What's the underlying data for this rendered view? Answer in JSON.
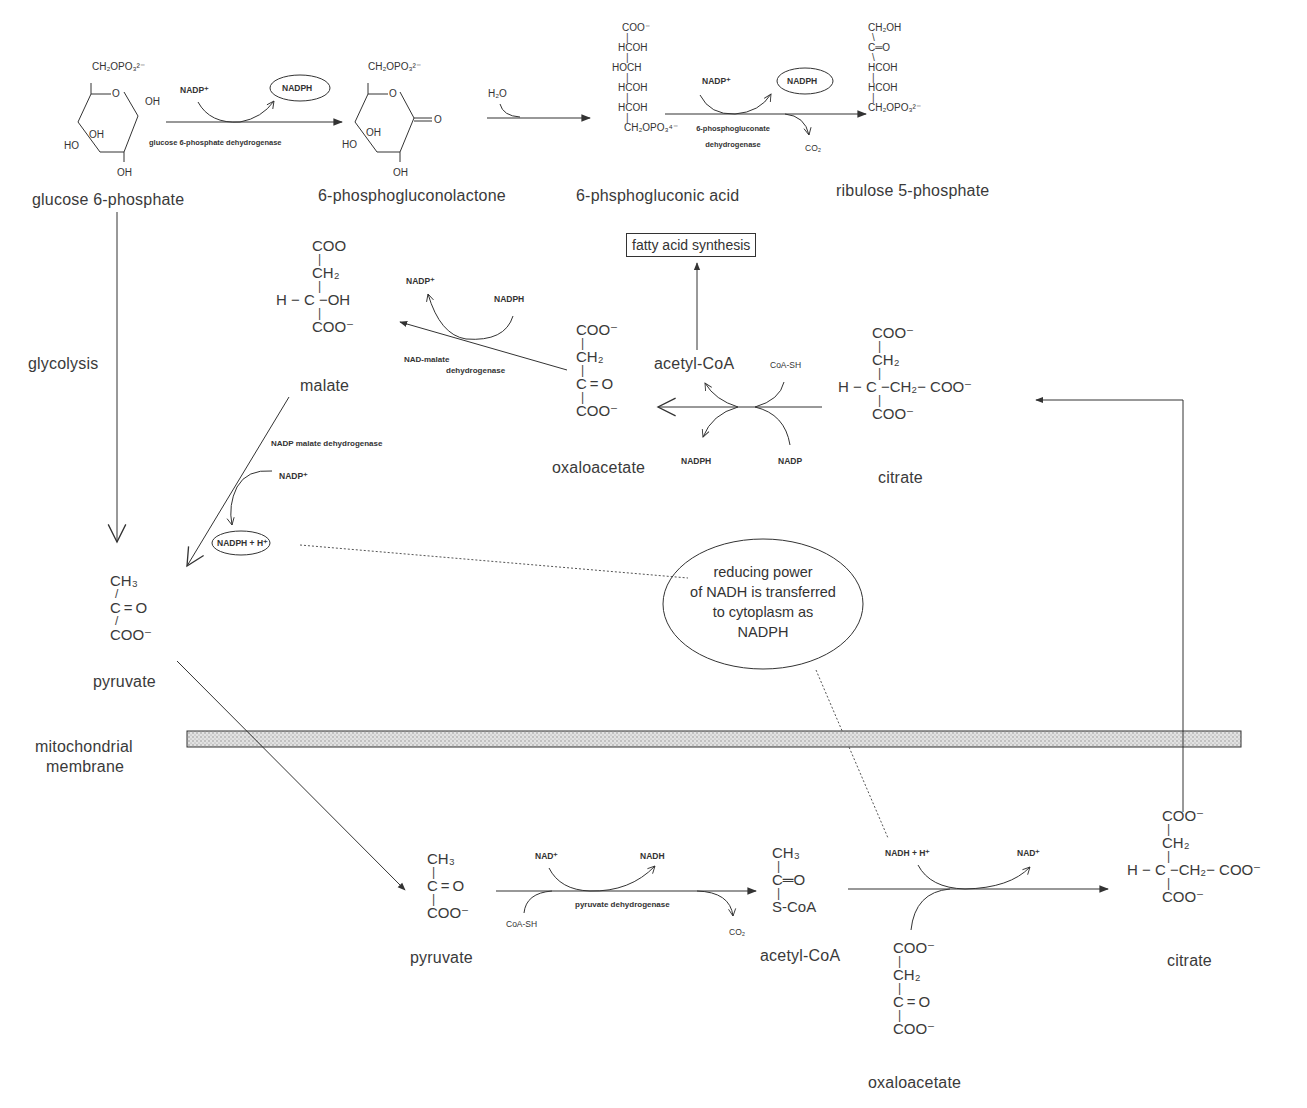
{
  "diagram": {
    "compartments": {
      "membrane_label_line1": "mitochondrial",
      "membrane_label_line2": "membrane"
    },
    "pentose_phosphate": {
      "g6p": {
        "name": "glucose 6-phosphate",
        "top": "CH₂OPO₃²⁻",
        "ring_o": "O",
        "oh1": "OH",
        "oh2": "OH",
        "oh3": "OH",
        "ho": "HO"
      },
      "step1": {
        "enzyme": "glucose 6-phosphate dehydrogenase",
        "cofactor_in": "NADP⁺",
        "cofactor_out": "NADPH"
      },
      "lactone": {
        "name": "6-phosphogluconolactone",
        "top": "CH₂OPO₃²⁻",
        "ring_o": "O",
        "carbonyl_o": "O",
        "oh1": "OH",
        "oh2": "OH",
        "ho": "HO"
      },
      "step2": {
        "reactant": "H₂O"
      },
      "gluconic": {
        "name": "6-phsphogluconic acid",
        "rows": [
          "COO⁻",
          "HCOH",
          "HOCH",
          "HCOH",
          "HCOH",
          "CH₂OPO₃⁴⁻"
        ]
      },
      "step3": {
        "enzyme_line1": "6-phosphogluconate",
        "enzyme_line2": "dehydrogenase",
        "cofactor_in": "NADP⁺",
        "cofactor_out": "NADPH",
        "byproduct": "CO₂"
      },
      "ribulose": {
        "name": "ribulose 5-phosphate",
        "rows": [
          "CH₂OH",
          "C═O",
          "HCOH",
          "HCOH",
          "CH₂OPO₃²⁻"
        ]
      }
    },
    "glycolysis_label": "glycolysis",
    "fatty_acid_box": "fatty acid synthesis",
    "cytoplasm": {
      "malate": {
        "name": "malate",
        "rows": [
          "COO",
          "CH₂",
          "H − C −OH",
          "COO⁻"
        ]
      },
      "nad_malate_dh": {
        "enzyme_line1": "NAD-malate",
        "enzyme_line2": "dehydrogenase",
        "cofactor_in": "NADPH",
        "cofactor_out": "NADP⁺"
      },
      "oxaloacetate": {
        "name": "oxaloacetate",
        "rows": [
          "COO⁻",
          "CH₂",
          "C = O",
          "COO⁻"
        ]
      },
      "citrate_lyase": {
        "product": "acetyl-CoA",
        "cofactor_in_top": "CoA-SH",
        "cofactor_out_bottom": "NADPH",
        "cofactor_in_bottom": "NADP"
      },
      "citrate": {
        "name": "citrate",
        "rows": [
          "COO⁻",
          "CH₂",
          "H − C −CH₂− COO⁻",
          "COO⁻"
        ]
      },
      "nadp_malate_dh": {
        "enzyme": "NADP malate dehydrogenase",
        "cofactor_in": "NADP⁺",
        "cofactor_out": "NADPH + H⁺"
      },
      "pyruvate": {
        "name": "pyruvate",
        "rows": [
          "CH₃",
          "C = O",
          "COO⁻"
        ]
      }
    },
    "callout": {
      "line1": "reducing power",
      "line2": "of NADH is transferred",
      "line3": "to cytoplasm as",
      "line4": "NADPH"
    },
    "mitochondria": {
      "pyruvate": {
        "name": "pyruvate",
        "rows": [
          "CH₃",
          "C = O",
          "COO⁻"
        ]
      },
      "pdh": {
        "enzyme": "pyruvate dehydrogenase",
        "cofactor_in": "NAD⁺",
        "cofactor_out": "NADH",
        "reactant": "CoA-SH",
        "byproduct": "CO₂"
      },
      "acetyl_coa": {
        "name": "acetyl-CoA",
        "rows": [
          "CH₃",
          "C═O",
          "S-CoA"
        ]
      },
      "citrate_synthase": {
        "cofactor_in": "NADH + H⁺",
        "cofactor_out": "NAD⁺"
      },
      "oxaloacetate": {
        "name": "oxaloacetate",
        "rows": [
          "COO⁻",
          "CH₂",
          "C = O",
          "COO⁻"
        ]
      },
      "citrate": {
        "name": "citrate",
        "rows": [
          "COO⁻",
          "CH₂",
          "H − C −CH₂− COO⁻",
          "COO⁻"
        ]
      }
    },
    "colors": {
      "ink": "#333333",
      "membrane_fill": "#d4d4d4",
      "background": "#ffffff"
    }
  }
}
